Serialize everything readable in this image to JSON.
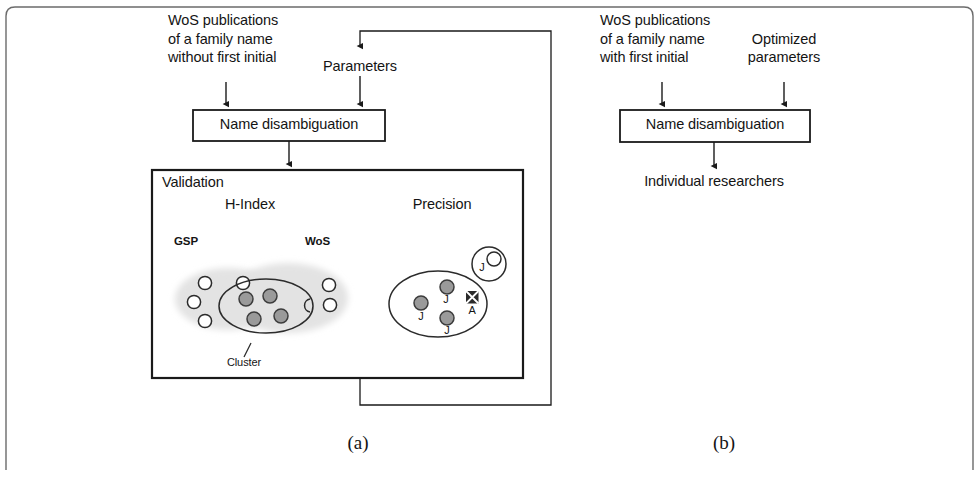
{
  "figure": {
    "width": 979,
    "height": 484,
    "background": "#ffffff",
    "line_color": "#1a1a1a",
    "blob_color": "#e3e3e3",
    "dot_fill": "#9a9a9a",
    "dot_stroke": "#3c3c3c",
    "marker_fill": "#2b2b2b"
  },
  "panel_a": {
    "caption": "(a)",
    "input_label": "WoS publications\nof a family name\nwithout first initial",
    "input_line_1": "WoS publications",
    "input_line_2": "of a family name",
    "input_line_3": "without first initial",
    "parameters_label": "Parameters",
    "process_box_label": "Name disambiguation",
    "validation": {
      "title": "Validation",
      "metric_left": "H-Index",
      "metric_right": "Precision",
      "source_left": "GSP",
      "source_right": "WoS",
      "cluster_label": "Cluster",
      "precision_markers": [
        {
          "label": "J",
          "type": "filled-dot"
        },
        {
          "label": "J",
          "type": "filled-dot"
        },
        {
          "label": "J",
          "type": "filled-dot"
        },
        {
          "label": "A",
          "type": "crossed-marker"
        }
      ],
      "outlier_label": "J"
    }
  },
  "panel_b": {
    "caption": "(b)",
    "input_line_1": "WoS publications",
    "input_line_2": "of a family name",
    "input_line_3": "with first initial",
    "parameters_line_1": "Optimized",
    "parameters_line_2": "parameters",
    "process_box_label": "Name disambiguation",
    "output_label": "Individual researchers"
  }
}
